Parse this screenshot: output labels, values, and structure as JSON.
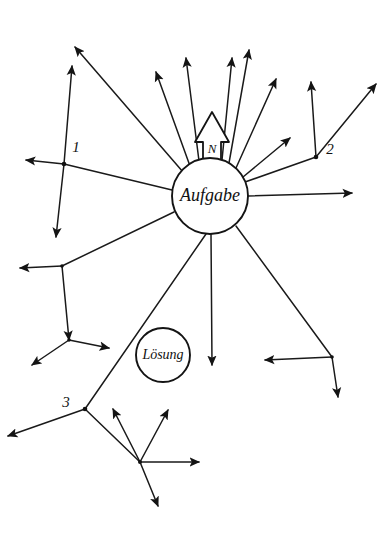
{
  "figure": {
    "title": "Aufgabe",
    "background_color": "#ffffff",
    "ink_color": "#1a1a1a",
    "width": 385,
    "height": 537
  },
  "center_node": {
    "label": "Aufgabe",
    "cx": 210,
    "cy": 196,
    "r": 38,
    "font_size": 18
  },
  "solution_node": {
    "label": "Lösung",
    "cx": 163,
    "cy": 355,
    "r": 27,
    "font_size": 14
  },
  "emphasis_arrow": {
    "label": "N",
    "font_size": 13,
    "tip_x": 212,
    "tip_y": 112,
    "base_y": 172,
    "half_width": 9,
    "head_half_width": 17
  },
  "index_labels": [
    {
      "name": "label-1",
      "text": "1",
      "x": 76,
      "y": 149,
      "font_size": 15
    },
    {
      "name": "label-2",
      "text": "2",
      "x": 330,
      "y": 151,
      "font_size": 15
    },
    {
      "name": "label-3",
      "text": "3",
      "x": 66,
      "y": 404,
      "font_size": 15
    },
    {
      "name": "label-n",
      "text": "N",
      "x": 212,
      "y": 137,
      "font_size": 13
    }
  ],
  "rays": [
    {
      "name": "ray-up-left-far",
      "x1": 183,
      "y1": 172,
      "x2": 75,
      "y2": 47,
      "arrow": true
    },
    {
      "name": "ray-up-left-mid",
      "x1": 190,
      "y1": 166,
      "x2": 156,
      "y2": 72,
      "arrow": true
    },
    {
      "name": "ray-up-left-near",
      "x1": 199,
      "y1": 161,
      "x2": 186,
      "y2": 58,
      "arrow": true
    },
    {
      "name": "ray-up-right-near",
      "x1": 222,
      "y1": 160,
      "x2": 232,
      "y2": 58,
      "arrow": true
    },
    {
      "name": "ray-up-right-mid",
      "x1": 229,
      "y1": 163,
      "x2": 249,
      "y2": 50,
      "arrow": true
    },
    {
      "name": "ray-up-right-far",
      "x1": 236,
      "y1": 168,
      "x2": 276,
      "y2": 79,
      "arrow": true
    },
    {
      "name": "ray-right-upper",
      "x1": 243,
      "y1": 177,
      "x2": 290,
      "y2": 138,
      "arrow": true
    },
    {
      "name": "ray-right-flat",
      "x1": 248,
      "y1": 196,
      "x2": 352,
      "y2": 193,
      "arrow": true
    },
    {
      "name": "ray-down",
      "x1": 211,
      "y1": 234,
      "x2": 212,
      "y2": 365,
      "arrow": true
    },
    {
      "name": "ray-left-flat",
      "x1": 172,
      "y1": 190,
      "x2": 64,
      "y2": 164,
      "arrow": false
    },
    {
      "name": "ray-left-lower",
      "x1": 174,
      "y1": 212,
      "x2": 62,
      "y2": 266,
      "arrow": false
    },
    {
      "name": "ray-node2-trunk",
      "x1": 245,
      "y1": 182,
      "x2": 316,
      "y2": 157,
      "arrow": false
    },
    {
      "name": "ray-down-right",
      "x1": 236,
      "y1": 226,
      "x2": 332,
      "y2": 357,
      "arrow": false
    },
    {
      "name": "ray-down-left-to-3",
      "x1": 206,
      "y1": 234,
      "x2": 85,
      "y2": 409,
      "arrow": false
    }
  ],
  "branches": [
    {
      "name": "branch-1-up",
      "x1": 64,
      "y1": 164,
      "x2": 72,
      "y2": 66,
      "arrow": true
    },
    {
      "name": "branch-1-left",
      "x1": 64,
      "y1": 164,
      "x2": 26,
      "y2": 160,
      "arrow": true
    },
    {
      "name": "branch-1-down",
      "x1": 64,
      "y1": 164,
      "x2": 56,
      "y2": 237,
      "arrow": true
    },
    {
      "name": "branch-2-up",
      "x1": 316,
      "y1": 157,
      "x2": 311,
      "y2": 82,
      "arrow": true
    },
    {
      "name": "branch-2-upright",
      "x1": 316,
      "y1": 157,
      "x2": 376,
      "y2": 84,
      "arrow": true
    },
    {
      "name": "branch-l1-left",
      "x1": 62,
      "y1": 266,
      "x2": 20,
      "y2": 268,
      "arrow": true
    },
    {
      "name": "branch-l1-down",
      "x1": 62,
      "y1": 266,
      "x2": 69,
      "y2": 340,
      "arrow": true
    },
    {
      "name": "branch-l2-right",
      "x1": 69,
      "y1": 340,
      "x2": 109,
      "y2": 348,
      "arrow": true
    },
    {
      "name": "branch-l2-downleft",
      "x1": 69,
      "y1": 340,
      "x2": 32,
      "y2": 365,
      "arrow": true
    },
    {
      "name": "branch-r1-left",
      "x1": 332,
      "y1": 357,
      "x2": 265,
      "y2": 360,
      "arrow": true
    },
    {
      "name": "branch-r1-down",
      "x1": 332,
      "y1": 357,
      "x2": 338,
      "y2": 397,
      "arrow": true
    },
    {
      "name": "branch-3-downleft",
      "x1": 85,
      "y1": 409,
      "x2": 8,
      "y2": 436,
      "arrow": true
    },
    {
      "name": "branch-3-to-fan",
      "x1": 85,
      "y1": 409,
      "x2": 140,
      "y2": 462,
      "arrow": false
    }
  ],
  "fan_branches": [
    {
      "name": "fan-up",
      "x1": 140,
      "y1": 462,
      "x2": 113,
      "y2": 409,
      "arrow": true
    },
    {
      "name": "fan-upright",
      "x1": 140,
      "y1": 462,
      "x2": 168,
      "y2": 410,
      "arrow": true
    },
    {
      "name": "fan-right",
      "x1": 140,
      "y1": 462,
      "x2": 199,
      "y2": 462,
      "arrow": true
    },
    {
      "name": "fan-downright",
      "x1": 140,
      "y1": 462,
      "x2": 158,
      "y2": 506,
      "arrow": true
    }
  ],
  "joints": [
    {
      "name": "joint-1",
      "cx": 64,
      "cy": 164,
      "r": 2.3
    },
    {
      "name": "joint-2",
      "cx": 316,
      "cy": 157,
      "r": 2.3
    },
    {
      "name": "joint-3",
      "cx": 85,
      "cy": 409,
      "r": 2.3
    },
    {
      "name": "joint-l1",
      "cx": 62,
      "cy": 266,
      "r": 1.8
    },
    {
      "name": "joint-l2",
      "cx": 69,
      "cy": 340,
      "r": 1.8
    },
    {
      "name": "joint-r1",
      "cx": 332,
      "cy": 357,
      "r": 1.8
    },
    {
      "name": "joint-fan",
      "cx": 140,
      "cy": 462,
      "r": 2.0
    }
  ]
}
